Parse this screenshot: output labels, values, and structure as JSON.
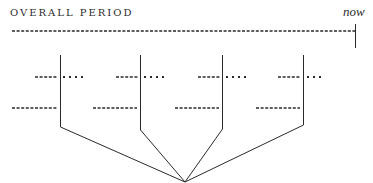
{
  "title": "OVERALL PERIOD",
  "now_label": "now",
  "colors": {
    "ink": "#2a2a2a",
    "background": "#ffffff"
  },
  "timeline": {
    "style": "dashed",
    "from_x": 12,
    "to_x": 355,
    "y": 31
  },
  "branches": [
    {
      "x": 60,
      "upper_dashes": [
        35,
        58
      ],
      "upper_dots": [
        63,
        83
      ],
      "lower_dashes": [
        12,
        57
      ]
    },
    {
      "x": 140,
      "upper_dashes": [
        116,
        138
      ],
      "upper_dots": [
        143,
        163
      ],
      "lower_dashes": [
        93,
        137
      ]
    },
    {
      "x": 222,
      "upper_dashes": [
        198,
        220
      ],
      "upper_dots": [
        225,
        245
      ],
      "lower_dashes": [
        175,
        219
      ]
    },
    {
      "x": 303,
      "upper_dashes": [
        278,
        301
      ],
      "upper_dots": [
        306,
        320
      ],
      "lower_dashes": [
        256,
        300
      ]
    }
  ],
  "convergence_point": {
    "x": 185,
    "y": 182
  }
}
